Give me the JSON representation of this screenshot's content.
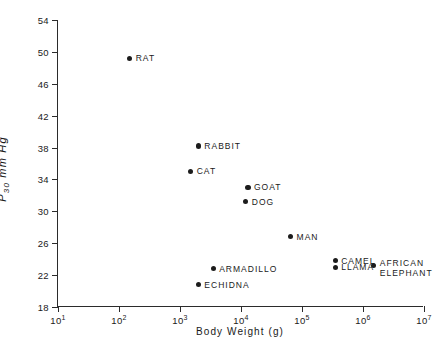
{
  "chart_data": {
    "type": "scatter",
    "title": "",
    "xlabel": "Body Weight (g)",
    "ylabel": "P30 mm Hg",
    "ylabel_base": "P",
    "ylabel_sub": "30",
    "ylabel_unit": " mm Hg",
    "xscale": "log",
    "yscale": "linear",
    "xlim": [
      10,
      10000000
    ],
    "ylim": [
      18,
      54
    ],
    "grid": false,
    "legend": "none",
    "frame": "open-L",
    "yticks": [
      {
        "value": 54,
        "label": "54"
      },
      {
        "value": 50,
        "label": "50"
      },
      {
        "value": 46,
        "label": "46"
      },
      {
        "value": 42,
        "label": "42"
      },
      {
        "value": 38,
        "label": "38"
      },
      {
        "value": 34,
        "label": "34"
      },
      {
        "value": 30,
        "label": "30"
      },
      {
        "value": 26,
        "label": "26"
      },
      {
        "value": 22,
        "label": "22"
      },
      {
        "value": 18,
        "label": "18"
      }
    ],
    "xticks": [
      {
        "exponent": 1,
        "mantissa": "10",
        "label": "10"
      },
      {
        "exponent": 2,
        "mantissa": "10",
        "label": "10"
      },
      {
        "exponent": 3,
        "mantissa": "10",
        "label": "10"
      },
      {
        "exponent": 4,
        "mantissa": "10",
        "label": "10"
      },
      {
        "exponent": 5,
        "mantissa": "10",
        "label": "10"
      },
      {
        "exponent": 6,
        "mantissa": "10",
        "label": "10"
      },
      {
        "exponent": 7,
        "mantissa": "10",
        "label": "10"
      }
    ],
    "marker_color": "#1c1c1c",
    "axis_color": "#2b2b2b",
    "points": [
      {
        "name": "RAT",
        "label": "RAT",
        "x": 150,
        "y": 49.2,
        "label_lines": [
          "RAT"
        ]
      },
      {
        "name": "RABBIT",
        "label": "RABBIT",
        "x": 2000,
        "y": 38.2,
        "label_lines": [
          "RABBIT"
        ]
      },
      {
        "name": "CAT",
        "label": "CAT",
        "x": 1500,
        "y": 35.0,
        "label_lines": [
          "CAT"
        ]
      },
      {
        "name": "GOAT",
        "label": "GOAT",
        "x": 13000,
        "y": 33.0,
        "label_lines": [
          "GOAT"
        ]
      },
      {
        "name": "DOG",
        "label": "DOG",
        "x": 12000,
        "y": 31.2,
        "label_lines": [
          "DOG"
        ]
      },
      {
        "name": "MAN",
        "label": "MAN",
        "x": 65000,
        "y": 26.8,
        "label_lines": [
          "MAN"
        ]
      },
      {
        "name": "CAMEL",
        "label": "CAMEL",
        "x": 350000,
        "y": 23.8,
        "label_lines": [
          "CAMEL"
        ]
      },
      {
        "name": "LLAMA",
        "label": "LLAMA",
        "x": 350000,
        "y": 23.0,
        "label_lines": [
          "LLAMA"
        ]
      },
      {
        "name": "ARMADILLO",
        "label": "ARMADILLO",
        "x": 3500,
        "y": 22.8,
        "label_lines": [
          "ARMADILLO"
        ]
      },
      {
        "name": "ECHIDNA",
        "label": "ECHIDNA",
        "x": 2000,
        "y": 20.8,
        "label_lines": [
          "ECHIDNA"
        ]
      },
      {
        "name": "AFRICAN-ELEPHANT",
        "label": "AFRICAN ELEPHANT",
        "x": 1500000,
        "y": 23.2,
        "label_lines": [
          "AFRICAN",
          "ELEPHANT"
        ]
      }
    ]
  }
}
